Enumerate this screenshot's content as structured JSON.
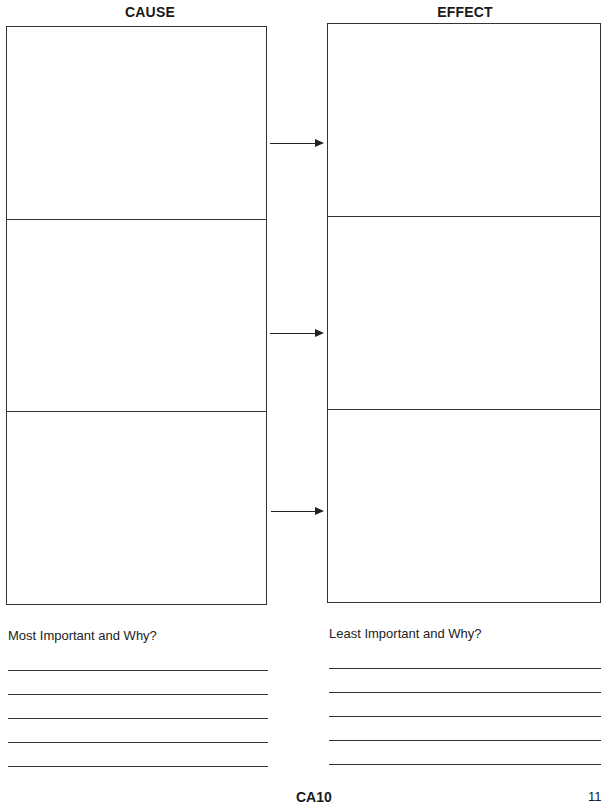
{
  "worksheet": {
    "cause_heading": "CAUSE",
    "effect_heading": "EFFECT",
    "rows": 3,
    "arrows": [
      {
        "from": "cause-1",
        "to": "effect-1"
      },
      {
        "from": "cause-2",
        "to": "effect-2"
      },
      {
        "from": "cause-3",
        "to": "effect-3"
      }
    ]
  },
  "responses": {
    "most_important": {
      "prompt": "Most Important and Why?",
      "line_count": 5
    },
    "least_important": {
      "prompt": "Least Important and Why?",
      "line_count": 5
    }
  },
  "footer": {
    "code": "CA10",
    "page_number": "11"
  }
}
